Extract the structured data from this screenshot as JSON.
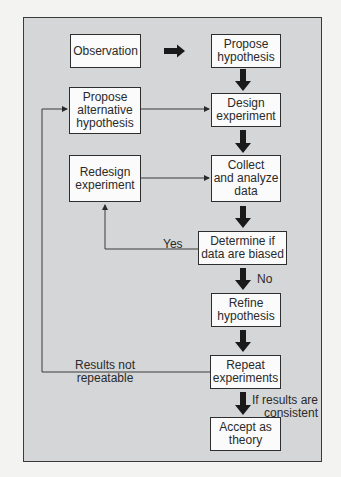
{
  "diagram": {
    "type": "flowchart",
    "title": "",
    "nodes": {
      "observation": "Observation",
      "propose_hypothesis": "Propose\nhypothesis",
      "propose_alternative": "Propose\nalternative\nhypothesis",
      "design_experiment": "Design\nexperiment",
      "redesign_experiment": "Redesign\nexperiment",
      "collect_analyze": "Collect\nand analyze\ndata",
      "determine_biased": "Determine if\ndata are biased",
      "refine_hypothesis": "Refine\nhypothesis",
      "repeat_experiments": "Repeat\nexperiments",
      "accept_theory": "Accept as\ntheory"
    },
    "edge_labels": {
      "yes": "Yes",
      "no": "No",
      "not_repeatable": "Results not\nrepeatable",
      "consistent": "If results are\nconsistent"
    },
    "edges": [
      {
        "from": "observation",
        "to": "propose_hypothesis"
      },
      {
        "from": "propose_hypothesis",
        "to": "design_experiment"
      },
      {
        "from": "design_experiment",
        "to": "collect_analyze"
      },
      {
        "from": "collect_analyze",
        "to": "determine_biased"
      },
      {
        "from": "determine_biased",
        "to": "redesign_experiment",
        "label": "Yes"
      },
      {
        "from": "redesign_experiment",
        "to": "collect_analyze"
      },
      {
        "from": "determine_biased",
        "to": "refine_hypothesis",
        "label": "No"
      },
      {
        "from": "refine_hypothesis",
        "to": "repeat_experiments"
      },
      {
        "from": "repeat_experiments",
        "to": "propose_alternative",
        "label": "Results not repeatable"
      },
      {
        "from": "propose_alternative",
        "to": "design_experiment"
      },
      {
        "from": "repeat_experiments",
        "to": "accept_theory",
        "label": "If results are consistent"
      }
    ],
    "colors": {
      "panel": "#d5d6d8",
      "box": "#fbfbfb",
      "stroke": "#2e2e2e",
      "arrow": "#1a1a1a"
    }
  }
}
